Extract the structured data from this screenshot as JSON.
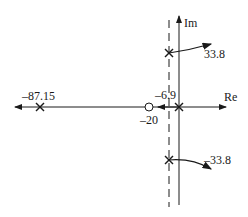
{
  "diagram": {
    "type": "root-locus",
    "axes": {
      "real_label": "Re",
      "imag_label": "Im"
    },
    "poles": [
      {
        "label": "-87.15",
        "real": -87.15,
        "imag": 0
      },
      {
        "label": "33.8",
        "real": -6.9,
        "imag": 33.8
      },
      {
        "label": "-33.8",
        "real": -6.9,
        "imag": -33.8
      },
      {
        "label": "",
        "real": 0,
        "imag": 0
      }
    ],
    "zeros": [
      {
        "label": "-20",
        "real": -20,
        "imag": 0
      }
    ],
    "asymptote": {
      "label": "-6.9",
      "real": -6.9,
      "style": "dashed"
    },
    "colors": {
      "stroke": "#1a1a1a",
      "background": "#ffffff"
    }
  }
}
